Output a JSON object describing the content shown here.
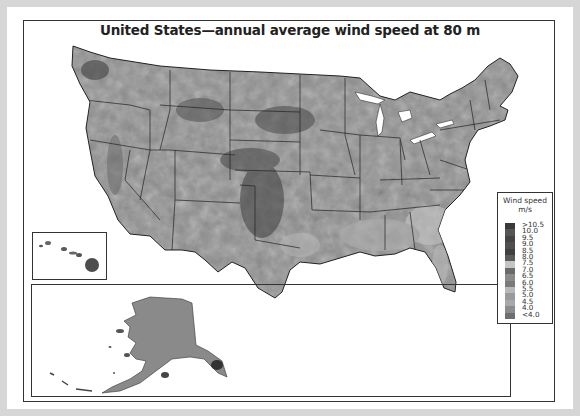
{
  "title": "United States—annual average wind speed at 80 m",
  "legend": {
    "title_line1": "Wind speed",
    "title_line2": "m/s",
    "entries": [
      {
        "label": ">10.5",
        "color": "#3a3a3a"
      },
      {
        "label": "10.0",
        "color": "#555555"
      },
      {
        "label": "9.5",
        "color": "#444444"
      },
      {
        "label": "9.0",
        "color": "#4f4f4f"
      },
      {
        "label": "8.5",
        "color": "#404040"
      },
      {
        "label": "8.0",
        "color": "#5a5a5a"
      },
      {
        "label": "7.5",
        "color": "#c4c4c4"
      },
      {
        "label": "7.0",
        "color": "#6a6a6a"
      },
      {
        "label": "6.5",
        "color": "#8a8a8a"
      },
      {
        "label": "6.0",
        "color": "#7a7a7a"
      },
      {
        "label": "5.5",
        "color": "#b8b8b8"
      },
      {
        "label": "5.0",
        "color": "#9a9a9a"
      },
      {
        "label": "4.5",
        "color": "#a8a8a8"
      },
      {
        "label": "4.0",
        "color": "#8c8c8c"
      },
      {
        "label": "<4.0",
        "color": "#6e6e6e"
      }
    ]
  },
  "insets": {
    "hawaii": "Hawaii",
    "alaska": "Alaska"
  },
  "colors": {
    "background": "#d6d6d6",
    "land": "#8f8f8f",
    "border": "#222222"
  }
}
